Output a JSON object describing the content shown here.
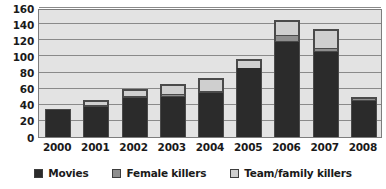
{
  "chart_data": {
    "type": "bar",
    "stacked": true,
    "title": "",
    "subtitle": "",
    "xlabel": "",
    "ylabel": "",
    "categories": [
      "2000",
      "2001",
      "2002",
      "2003",
      "2004",
      "2005",
      "2006",
      "2007",
      "2008"
    ],
    "series": [
      {
        "name": "Movies",
        "color": "#2b2b2b",
        "values": [
          33,
          37,
          48,
          50,
          55,
          85,
          118,
          105,
          45
        ]
      },
      {
        "name": "Female killers",
        "color": "#8e8e8e",
        "values": [
          0,
          2,
          3,
          3,
          2,
          0,
          8,
          5,
          4
        ]
      },
      {
        "name": "Team/family killers",
        "color": "#cfcfcf",
        "values": [
          0,
          5,
          7,
          12,
          15,
          10,
          18,
          23,
          0
        ]
      }
    ],
    "totals": [
      33,
      44,
      58,
      65,
      72,
      95,
      144,
      133,
      49
    ],
    "ylim": [
      0,
      160
    ],
    "yticks": [
      0,
      20,
      40,
      60,
      80,
      100,
      120,
      140,
      160
    ],
    "ytick_labels": [
      "0",
      "20",
      "40",
      "60",
      "80",
      "100",
      "120",
      "140",
      "160"
    ],
    "grid": true,
    "legend_position": "bottom",
    "plot_background": "#e3e3e3",
    "gridline_color": "#8a8a8a",
    "border_color": "#7d7d7d"
  },
  "legend": {
    "items": [
      {
        "label": "Movies",
        "color": "#2b2b2b",
        "icon": "square-swatch-icon"
      },
      {
        "label": "Female killers",
        "color": "#8e8e8e",
        "icon": "square-swatch-icon"
      },
      {
        "label": "Team/family killers",
        "color": "#cfcfcf",
        "icon": "square-swatch-icon"
      }
    ]
  }
}
